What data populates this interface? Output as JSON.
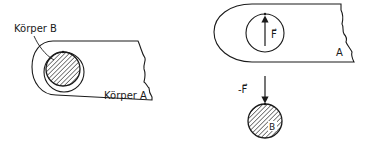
{
  "left_figure": {
    "label_body_b": "Körper B",
    "label_body_a": "Körper A"
  },
  "right_figure": {
    "force_label": "F⃗",
    "body_a_label": "A",
    "reaction_force_label": "-F⃗",
    "body_b_label": "B"
  },
  "colors": {
    "ink": "#1a1a1a",
    "background": "#ffffff"
  }
}
